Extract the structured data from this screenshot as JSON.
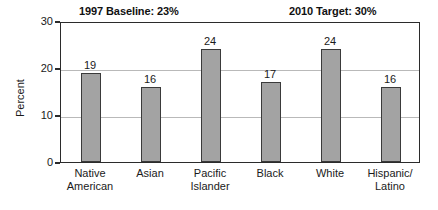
{
  "annotations": {
    "baseline": "1997 Baseline: 23%",
    "target": "2010 Target: 30%"
  },
  "axis": {
    "y_title": "Percent",
    "ticks": [
      "0",
      "10",
      "20",
      "30"
    ]
  },
  "chart_data": {
    "type": "bar",
    "title": "",
    "subtitle": "",
    "xlabel": "",
    "ylabel": "Percent",
    "ylim": [
      0,
      30
    ],
    "yticks": [
      0,
      10,
      20,
      30
    ],
    "grid": true,
    "legend": false,
    "categories": [
      "Native\nAmerican",
      "Asian",
      "Pacific\nIslander",
      "Black",
      "White",
      "Hispanic/\nLatino"
    ],
    "values": [
      19,
      16,
      24,
      17,
      24,
      16
    ],
    "bar_labels": [
      "19",
      "16",
      "24",
      "17",
      "24",
      "16"
    ],
    "annotations": [
      "1997 Baseline: 23%",
      "2010 Target: 30%"
    ],
    "colors": {
      "bar_fill": "#a3a3a3",
      "bar_edge": "#3a3a3a",
      "grid": "#b9b9b9",
      "frame": "#2b2b2b",
      "background": "#ffffff"
    }
  }
}
